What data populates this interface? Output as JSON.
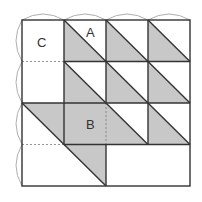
{
  "diagram": {
    "title": "",
    "grid": {
      "cols": 4,
      "rows": 4,
      "x0": 22,
      "y0": 20,
      "cell_w": 42,
      "cell_h": 41.5
    },
    "colors": {
      "shade": "#c8c8c8",
      "line": "#333333",
      "dash": "#777777",
      "arc": "#999999",
      "background": "#ffffff"
    },
    "labels": [
      {
        "id": "C",
        "text": "C",
        "x": 42,
        "y": 47
      },
      {
        "id": "A",
        "text": "A",
        "x": 91,
        "y": 37
      },
      {
        "id": "B",
        "text": "B",
        "x": 91,
        "y": 129
      }
    ]
  }
}
